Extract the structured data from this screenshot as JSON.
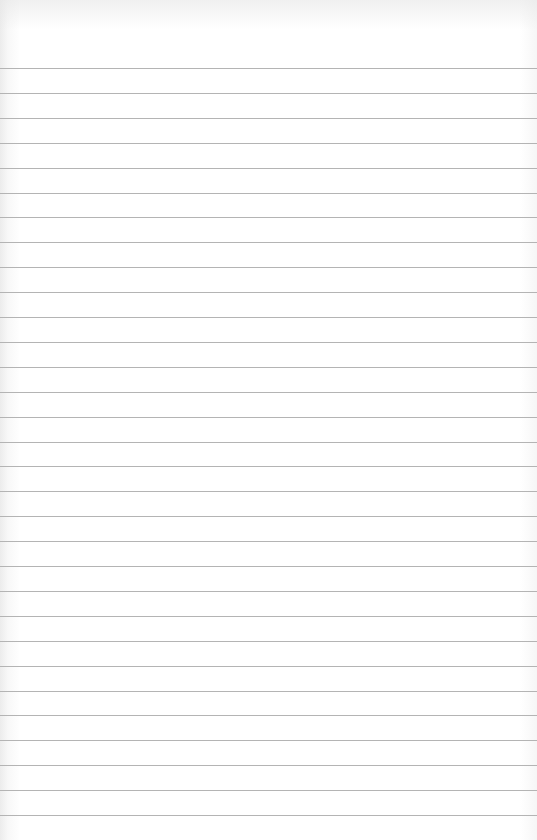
{
  "paper": {
    "type": "ruled notebook page",
    "background_color": "#ffffff",
    "line_color": "#b4b4b4",
    "line_count": 31,
    "first_line_y": 68,
    "line_spacing": 24.9,
    "text_content": []
  }
}
